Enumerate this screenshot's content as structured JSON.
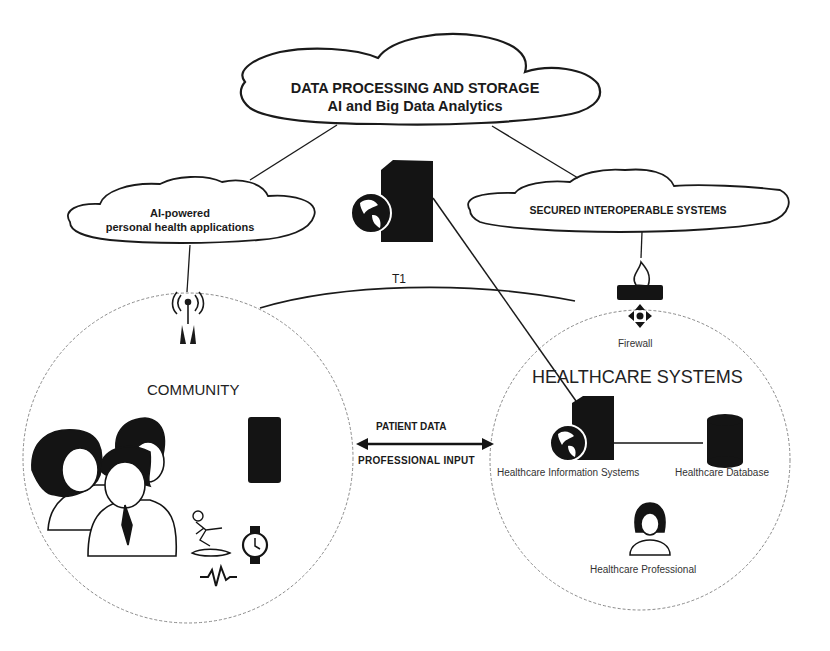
{
  "clouds": {
    "top": {
      "line1": "DATA PROCESSING AND STORAGE",
      "line2": "AI and Big Data Analytics"
    },
    "left": {
      "line1": "AI-powered",
      "line2": "personal health applications"
    },
    "right": {
      "label": "SECURED INTEROPERABLE SYSTEMS"
    }
  },
  "links": {
    "t1": "T1"
  },
  "community": {
    "title": "COMMUNITY",
    "icons": [
      "antenna-icon",
      "people-group-icon",
      "smartphone-icon",
      "fall-detection-icon",
      "smartwatch-icon",
      "heartbeat-icon"
    ]
  },
  "exchange": {
    "top_label": "PATIENT DATA",
    "bottom_label": "PROFESSIONAL INPUT"
  },
  "healthcare": {
    "title": "HEALTHCARE SYSTEMS",
    "firewall_label": "Firewall",
    "his_label": "Healthcare Information Systems",
    "db_label": "Healthcare Database",
    "professional_label": "Healthcare Professional"
  },
  "colors": {
    "stroke": "#1a1a1a",
    "fill_dark": "#141414",
    "circle_dash": "#8a8a8a",
    "background": "#ffffff"
  }
}
